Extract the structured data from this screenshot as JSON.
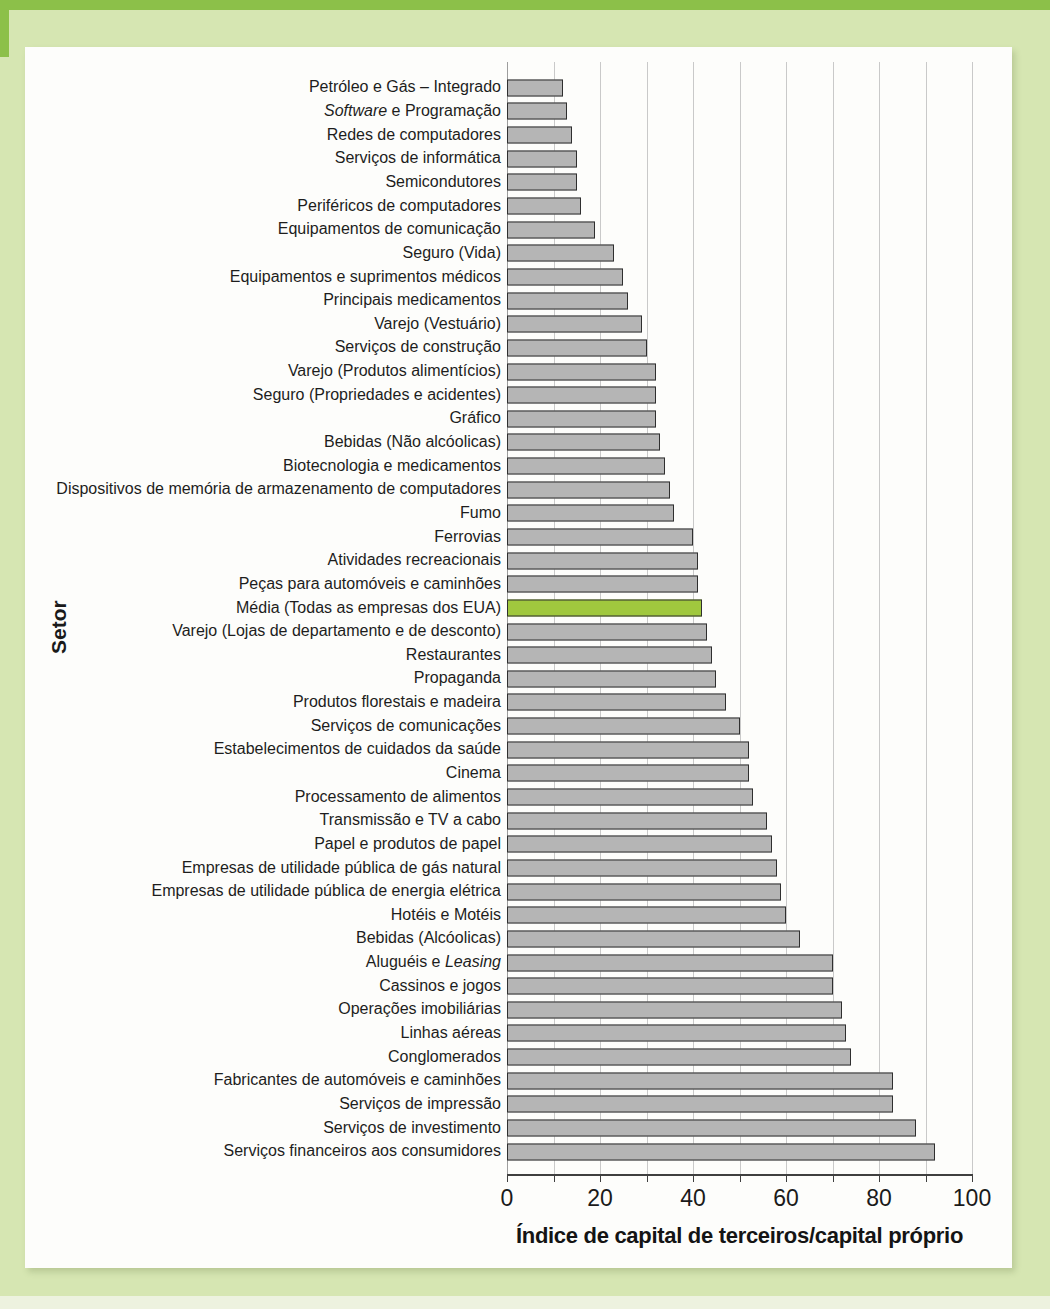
{
  "page": {
    "background": "#d6e6b2",
    "accent_band_color": "#8cc049",
    "panel_background": "#fdfdfb"
  },
  "chart_data": {
    "type": "bar",
    "orientation": "horizontal",
    "title": "",
    "xlabel": "Índice de capital de terceiros/capital próprio",
    "ylabel": "Setor",
    "xlim": [
      0,
      100
    ],
    "x_ticks": [
      0,
      20,
      40,
      60,
      80,
      100
    ],
    "x_tick_labels": [
      "0",
      "20",
      "40",
      "60",
      "80",
      "100"
    ],
    "gridline_step": 10,
    "grid": true,
    "bar_color": "#b5b5b5",
    "bar_border_color": "#2f2f2f",
    "highlight_color": "#a0c83e",
    "highlight_index": 22,
    "italic_words": {
      "1": "Software",
      "37": "Leasing"
    },
    "categories": [
      "Petróleo e Gás – Integrado",
      "Software e Programação",
      "Redes de computadores",
      "Serviços de informática",
      "Semicondutores",
      "Periféricos de computadores",
      "Equipamentos de comunicação",
      "Seguro (Vida)",
      "Equipamentos e suprimentos médicos",
      "Principais medicamentos",
      "Varejo (Vestuário)",
      "Serviços de construção",
      "Varejo (Produtos alimentícios)",
      "Seguro (Propriedades e acidentes)",
      "Gráfico",
      "Bebidas (Não alcóolicas)",
      "Biotecnologia e medicamentos",
      "Dispositivos de memória de armazenamento de computadores",
      "Fumo",
      "Ferrovias",
      "Atividades recreacionais",
      "Peças para automóveis e caminhões",
      "Média (Todas as empresas dos EUA)",
      "Varejo (Lojas de departamento e de desconto)",
      "Restaurantes",
      "Propaganda",
      "Produtos florestais e madeira",
      "Serviços de comunicações",
      "Estabelecimentos de cuidados da saúde",
      "Cinema",
      "Processamento de alimentos",
      "Transmissão e TV a cabo",
      "Papel e produtos de papel",
      "Empresas de utilidade pública de gás natural",
      "Empresas de utilidade pública de energia elétrica",
      "Hotéis e Motéis",
      "Bebidas (Alcóolicas)",
      "Aluguéis e Leasing",
      "Cassinos e jogos",
      "Operações imobiliárias",
      "Linhas aéreas",
      "Conglomerados",
      "Fabricantes de automóveis e caminhões",
      "Serviços de impressão",
      "Serviços de investimento",
      "Serviços financeiros aos consumidores"
    ],
    "values": [
      12,
      13,
      14,
      15,
      15,
      16,
      19,
      23,
      25,
      26,
      29,
      30,
      32,
      32,
      32,
      33,
      34,
      35,
      36,
      40,
      41,
      41,
      42,
      43,
      44,
      45,
      47,
      50,
      52,
      52,
      53,
      56,
      57,
      58,
      59,
      60,
      63,
      70,
      70,
      72,
      73,
      74,
      83,
      83,
      88,
      92
    ]
  }
}
